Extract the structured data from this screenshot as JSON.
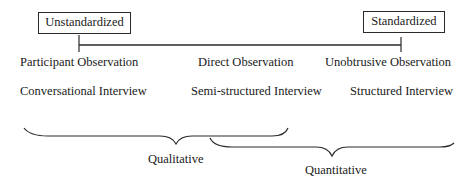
{
  "diagram": {
    "axis": {
      "left_label": "Unstandardized",
      "right_label": "Standardized"
    },
    "observation_methods": [
      "Participant Observation",
      "Direct Observation",
      "Unobtrusive Observation"
    ],
    "interview_methods": [
      "Conversational Interview",
      "Semi-structured Interview",
      "Structured Interview"
    ],
    "groupings": [
      {
        "label": "Qualitative",
        "spans": "Conversational Interview to Semi-structured Interview"
      },
      {
        "label": "Quantitative",
        "spans": "Semi-structured Interview to Structured Interview"
      }
    ],
    "colors": {
      "line": "#2a2a2a",
      "text": "#1a1a1a",
      "background": "#ffffff"
    }
  }
}
